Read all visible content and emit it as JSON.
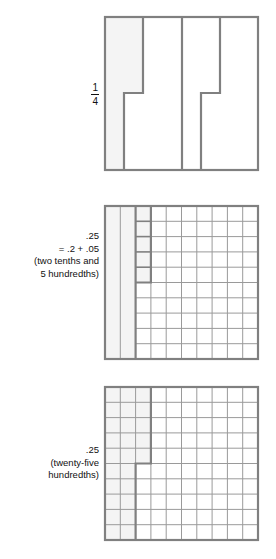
{
  "page": {
    "background": "#ffffff"
  },
  "style": {
    "outline_color": "#808080",
    "grid_line_color": "#9a9a9a",
    "shade_color": "#f4f4f4",
    "text_color": "#111111"
  },
  "figures": [
    {
      "id": "fourths-square",
      "label": {
        "type": "fraction",
        "numerator": "1",
        "denominator": "4"
      },
      "model": {
        "kind": "partitioned-square",
        "parts": 4,
        "shaded_parts": 1,
        "part_shape": "stepped-vertical-strip",
        "step_fraction": 0.5
      }
    },
    {
      "id": "tenths-hundredths-grid",
      "label": {
        "type": "lines",
        "lines": [
          ".25",
          "= .2 + .05",
          "(two tenths and",
          "5 hundredths)"
        ]
      },
      "model": {
        "kind": "mixed-grid",
        "columns": 10,
        "rows": 10,
        "full_strip_columns": 2,
        "partial_column_cells": 5,
        "total_shaded_hundredths": 25
      }
    },
    {
      "id": "hundredths-grid",
      "label": {
        "type": "lines",
        "lines": [
          ".25",
          "(twenty-five",
          "hundredths)"
        ]
      },
      "model": {
        "kind": "hundredths-grid",
        "columns": 10,
        "rows": 10,
        "shaded_cells": 25,
        "shaded_full_columns": 2,
        "shaded_partial_column_cells": 5
      }
    }
  ]
}
